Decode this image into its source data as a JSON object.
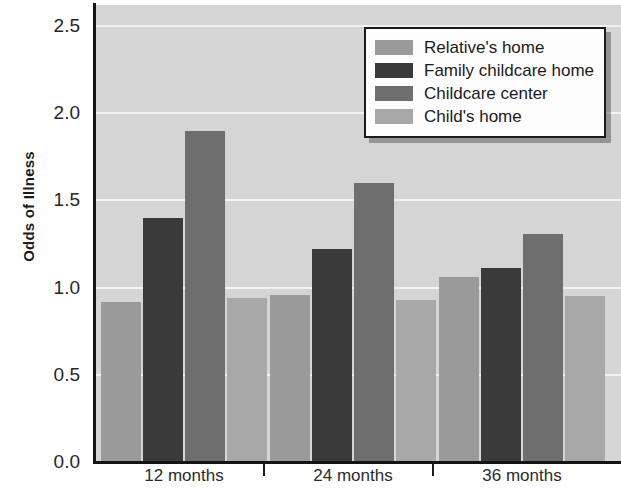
{
  "chart_data": {
    "type": "bar",
    "title": "",
    "xlabel": "",
    "ylabel": "Odds of Illness",
    "categories": [
      "12 months",
      "24 months",
      "36 months"
    ],
    "ylim": [
      0.0,
      2.5
    ],
    "yticks": [
      "0.0",
      "0.5",
      "1.0",
      "1.5",
      "2.0",
      "2.5"
    ],
    "ytick_values": [
      0.0,
      0.5,
      1.0,
      1.5,
      2.0,
      2.5
    ],
    "grid": true,
    "legend_position": "top-right",
    "series": [
      {
        "name": "Relative's home",
        "color": "#9a9a9a",
        "values": [
          0.92,
          0.96,
          1.06
        ]
      },
      {
        "name": "Family childcare home",
        "color": "#3a3a3a",
        "values": [
          1.4,
          1.22,
          1.11
        ]
      },
      {
        "name": "Childcare center",
        "color": "#6e6e6e",
        "values": [
          1.9,
          1.6,
          1.31
        ]
      },
      {
        "name": "Child's home",
        "color": "#a8a8a8",
        "values": [
          0.94,
          0.93,
          0.95
        ]
      }
    ]
  },
  "style": {
    "plot_background": "#d5d5d5",
    "gridline_color": "#f2f2f2",
    "axis_color": "#141414",
    "legend_background": "#fdfdfd",
    "legend_border": "#1a1a1a",
    "text_color": "#1b1b1b"
  }
}
